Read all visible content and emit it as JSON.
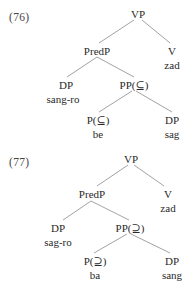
{
  "examples": [
    {
      "number": "(76)",
      "nodes": {
        "root": {
          "label": "VP"
        },
        "predp": {
          "label": "PredP"
        },
        "v": {
          "label": "V",
          "word": "zad"
        },
        "dp_subj": {
          "label": "DP",
          "word": "sang-ro"
        },
        "pp": {
          "label": "PP(⊆)"
        },
        "p": {
          "label": "P(⊆)",
          "word": "be"
        },
        "dp_obj": {
          "label": "DP",
          "word": "sag"
        }
      }
    },
    {
      "number": "(77)",
      "nodes": {
        "root": {
          "label": "VP"
        },
        "predp": {
          "label": "PredP"
        },
        "v": {
          "label": "V",
          "word": "zad"
        },
        "dp_subj": {
          "label": "DP",
          "word": "sag-ro"
        },
        "pp": {
          "label": "PP(⊇)"
        },
        "p": {
          "label": "P(⊇)",
          "word": "ba"
        },
        "dp_obj": {
          "label": "DP",
          "word": "sang"
        }
      }
    }
  ]
}
